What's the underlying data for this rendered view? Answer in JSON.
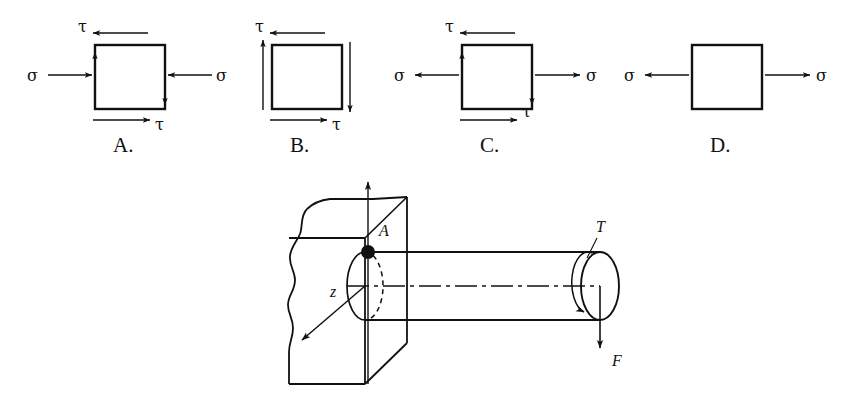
{
  "figure": {
    "background_color": "#ffffff",
    "line_color": "#111111"
  },
  "options": [
    {
      "id": "A",
      "label": "A.",
      "description": "Square stress element with compressive normal stress and shear",
      "normal_stress_symbol": "σ",
      "shear_stress_symbol": "τ",
      "normal_left_label": "σ",
      "normal_right_label": "σ",
      "shear_top_label": "τ",
      "shear_bottom_label": "τ",
      "normal_direction": "inward",
      "shear_top_direction": "left",
      "shear_bottom_direction": "right",
      "shear_left_direction": "up",
      "shear_right_direction": "down"
    },
    {
      "id": "B",
      "label": "B.",
      "description": "Square stress element in pure shear, no normal stress",
      "shear_stress_symbol": "τ",
      "shear_top_label": "τ",
      "shear_bottom_label": "τ",
      "normal_direction": "none",
      "shear_top_direction": "left",
      "shear_bottom_direction": "right",
      "shear_left_direction": "up",
      "shear_right_direction": "down"
    },
    {
      "id": "C",
      "label": "C.",
      "description": "Square stress element with tensile normal stress and shear",
      "normal_stress_symbol": "σ",
      "shear_stress_symbol": "τ",
      "normal_left_label": "σ",
      "normal_right_label": "σ",
      "shear_top_label": "τ",
      "shear_bottom_label": "τ",
      "normal_direction": "outward",
      "shear_top_direction": "left",
      "shear_bottom_direction": "right",
      "shear_left_direction": "up",
      "shear_right_direction": "down"
    },
    {
      "id": "D",
      "label": "D.",
      "description": "Square stress element in pure tension, no shear",
      "normal_stress_symbol": "σ",
      "normal_left_label": "σ",
      "normal_right_label": "σ",
      "normal_direction": "outward",
      "shear_top_direction": "none",
      "shear_bottom_direction": "none"
    }
  ],
  "shaft_diagram": {
    "description": "Cylindrical shaft cantilevered from a wall, loaded by torque T and transverse force F at the free end",
    "point_label": "A",
    "axis_z_label": "z",
    "torque_label": "T",
    "force_label": "F",
    "force_direction": "down",
    "support": "wall",
    "centerline_style": "dash-dot"
  }
}
